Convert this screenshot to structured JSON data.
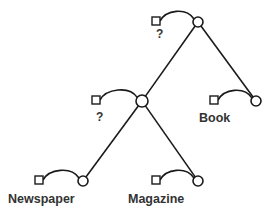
{
  "diagram": {
    "type": "tree",
    "nodes": [
      {
        "id": "root",
        "label": "?",
        "square": [
          152,
          17
        ],
        "circle": [
          198,
          22
        ],
        "r": 5,
        "label_pos": [
          156,
          38
        ]
      },
      {
        "id": "mid",
        "label": "?",
        "square": [
          92,
          96
        ],
        "circle": [
          142,
          101
        ],
        "r": 6,
        "label_pos": [
          96,
          121
        ]
      },
      {
        "id": "book",
        "label": "Book",
        "square": [
          210,
          96
        ],
        "circle": [
          256,
          101
        ],
        "r": 5,
        "label_pos": [
          199,
          122
        ]
      },
      {
        "id": "newspaper",
        "label": "Newspaper",
        "square": [
          35,
          176
        ],
        "circle": [
          83,
          181
        ],
        "r": 5,
        "label_pos": [
          8,
          203
        ]
      },
      {
        "id": "magazine",
        "label": "Magazine",
        "square": [
          152,
          176
        ],
        "circle": [
          198,
          181
        ],
        "r": 5,
        "label_pos": [
          128,
          203
        ]
      }
    ],
    "edges": [
      {
        "from": "root",
        "to": "mid"
      },
      {
        "from": "root",
        "to": "book"
      },
      {
        "from": "mid",
        "to": "newspaper"
      },
      {
        "from": "mid",
        "to": "magazine"
      }
    ],
    "colors": {
      "stroke": "#1a1a1a",
      "text": "#333333",
      "background": "#ffffff"
    }
  }
}
